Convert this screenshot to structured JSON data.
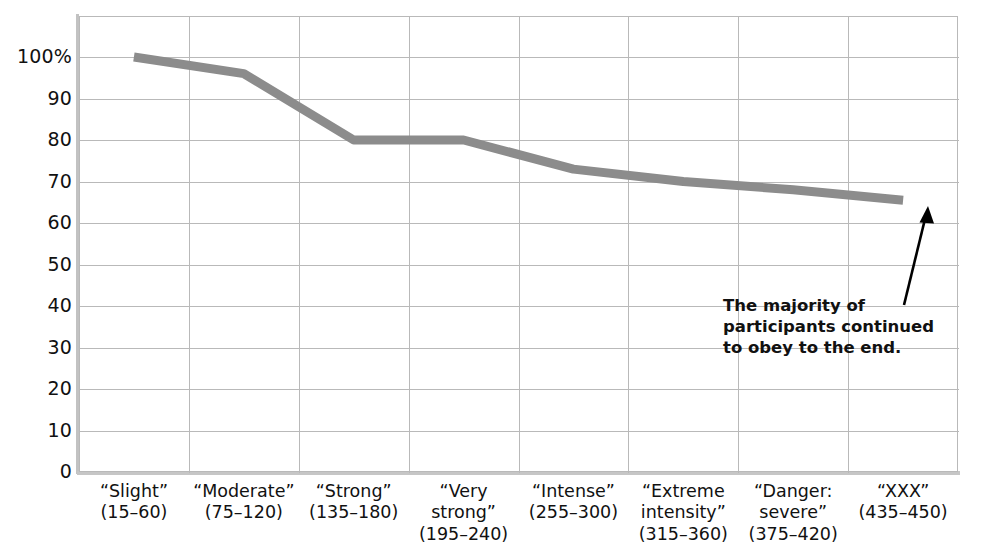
{
  "chart_data": {
    "type": "line",
    "title": "",
    "subtitle": "",
    "xlabel": "",
    "ylabel": "",
    "ylim": [
      0,
      100
    ],
    "grid": true,
    "legend": "none",
    "categories": [
      "“Slight”\n(15–60)",
      "“Moderate”\n(75–120)",
      "“Strong”\n(135–180)",
      "“Very\nstrong”\n(195–240)",
      "“Intense”\n(255–300)",
      "“Extreme\nintensity”\n(315–360)",
      "“Danger:\nsevere”\n(375–420)",
      "“XXX”\n(435–450)"
    ],
    "category_names": [
      "“Slight”",
      "“Moderate”",
      "“Strong”",
      "“Very strong”",
      "“Intense”",
      "“Extreme intensity”",
      "“Danger: severe”",
      "“XXX”"
    ],
    "category_ranges": [
      "(15–60)",
      "(75–120)",
      "(135–180)",
      "(195–240)",
      "(255–300)",
      "(315–360)",
      "(375–420)",
      "(435–450)"
    ],
    "values": [
      100,
      96,
      80,
      80,
      73,
      70,
      68,
      65.5
    ],
    "yticks": [
      "0",
      "10",
      "20",
      "30",
      "40",
      "50",
      "60",
      "70",
      "80",
      "90",
      "100%"
    ],
    "ytick_values": [
      0,
      10,
      20,
      30,
      40,
      50,
      60,
      70,
      80,
      90,
      100
    ],
    "series": [
      {
        "name": "Percentage of participants obeying",
        "values": [
          100,
          96,
          80,
          80,
          73,
          70,
          68,
          65.5
        ]
      }
    ],
    "annotations": [
      {
        "text": "The majority of\nparticipants continued\nto obey to the end.",
        "target_category": "“XXX” (435–450)"
      }
    ],
    "colors": {
      "line": "#8c8c8c",
      "grid": "#b9b9b9",
      "axis": "#c2c2c2",
      "text": "#111111",
      "arrow": "#000000",
      "background": "#ffffff"
    }
  }
}
